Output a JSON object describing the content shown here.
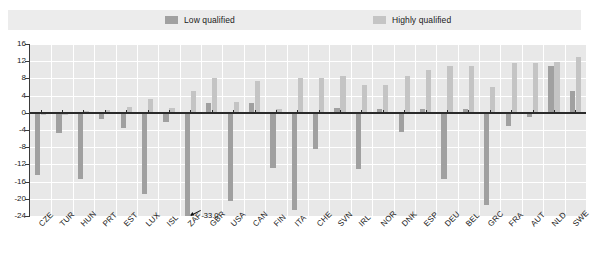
{
  "legend": {
    "items": [
      {
        "label": "Low qualified",
        "color": "#a0a0a0",
        "key": "low"
      },
      {
        "label": "Highly qualified",
        "color": "#c4c4c4",
        "key": "high"
      }
    ]
  },
  "axis": {
    "yticks": [
      "16",
      "12",
      "8",
      "4",
      "0",
      "-4",
      "-8",
      "-12",
      "-16",
      "-20",
      "-24"
    ],
    "ytick_values": [
      16,
      12,
      8,
      4,
      0,
      -4,
      -8,
      -12,
      -16,
      -20,
      -24
    ],
    "ymin": -24,
    "ymax": 16
  },
  "annotations": [
    {
      "text": "-33.0",
      "category": "ZAF",
      "series": "low"
    }
  ],
  "chart_data": {
    "type": "bar",
    "title": "",
    "subtitle": "",
    "xlabel": "",
    "ylabel": "",
    "ylim": [
      -24,
      16
    ],
    "grid": true,
    "legend_position": "top",
    "orientation": "vertical",
    "categories": [
      "CZE",
      "TUR",
      "HUN",
      "PRT",
      "EST",
      "LUX",
      "ISL",
      "ZAF",
      "GBR",
      "USA",
      "CAN",
      "FIN",
      "ITA",
      "CHE",
      "SVN",
      "IRL",
      "NOR",
      "DNK",
      "ESP",
      "DEU",
      "BEL",
      "GRC",
      "FRA",
      "AUT",
      "NLD",
      "SWE"
    ],
    "series": [
      {
        "name": "Low qualified",
        "color": "#a0a0a0",
        "values": [
          -14.5,
          -4.8,
          -15.5,
          -1.5,
          -3.5,
          -19.0,
          -2.2,
          -33.0,
          2.2,
          -20.5,
          2.2,
          -12.8,
          -22.5,
          -8.5,
          1.2,
          -13.0,
          0.8,
          -4.5,
          0.8,
          -15.5,
          1.0,
          -21.5,
          -3.0,
          -1.0,
          11.0,
          5.0
        ]
      },
      {
        "name": "Highly qualified",
        "color": "#c4c4c4",
        "values": [
          -0.6,
          -0.6,
          0.4,
          0.6,
          1.4,
          3.2,
          1.2,
          5.0,
          8.0,
          2.5,
          7.5,
          1.0,
          8.0,
          8.2,
          8.5,
          6.5,
          6.5,
          8.5,
          10.0,
          11.0,
          11.0,
          6.0,
          11.5,
          11.5,
          11.8,
          13.0
        ]
      }
    ]
  }
}
